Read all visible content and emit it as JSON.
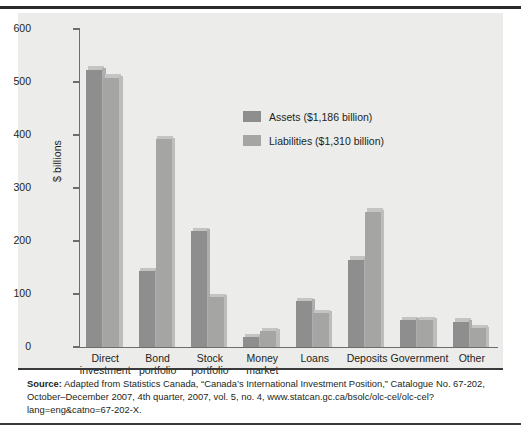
{
  "chart_data": {
    "type": "bar",
    "title": "",
    "xlabel": "",
    "ylabel": "$ billions",
    "ylim": [
      0,
      600
    ],
    "yticks": [
      0,
      100,
      200,
      300,
      400,
      500,
      600
    ],
    "grid": false,
    "legend_position": "inside-upper-right",
    "categories": [
      "Direct investment",
      "Bond portfolio",
      "Stock portfolio",
      "Money market",
      "Loans",
      "Deposits",
      "Government",
      "Other"
    ],
    "category_lines": [
      [
        "Direct",
        "investment"
      ],
      [
        "Bond",
        "portfolio"
      ],
      [
        "Stock",
        "portfolio"
      ],
      [
        "Money",
        "market"
      ],
      [
        "Loans"
      ],
      [
        "Deposits"
      ],
      [
        "Government"
      ],
      [
        "Other"
      ]
    ],
    "series": [
      {
        "name": "Assets ($1,186 billion)",
        "color": "#8e8e8e",
        "values": [
          523,
          143,
          219,
          19,
          87,
          165,
          51,
          48
        ]
      },
      {
        "name": "Liabilities ($1,310 billion)",
        "color": "#a5a5a4",
        "values": [
          508,
          392,
          94,
          30,
          64,
          255,
          51,
          35
        ]
      }
    ]
  },
  "legend": {
    "items": [
      {
        "label": "Assets ($1,186 billion)",
        "swatch": "#8e8e8e"
      },
      {
        "label": "Liabilities ($1,310 billion)",
        "swatch": "#a5a5a4"
      }
    ]
  },
  "axis": {
    "y_label": "$ billions",
    "y_tick_labels": [
      "600",
      "500",
      "400",
      "300",
      "200",
      "100",
      "0"
    ]
  },
  "source": {
    "prefix": "Source:",
    "text": " Adapted from Statistics Canada, “Canada’s International Investment Position,” Catalogue No. 67-202, October–December 2007, 4th quarter, 2007, vol. 5, no. 4, www.statcan.gc.ca/bsolc/olc-cel/olc-cel?lang=eng&catno=67-202-X."
  },
  "colors": {
    "panel_background": "#ececeb",
    "assets": "#8e8e8e",
    "liabilities": "#a5a5a4",
    "axis": "#6d6d6d",
    "rule": "#2b2b2b"
  }
}
